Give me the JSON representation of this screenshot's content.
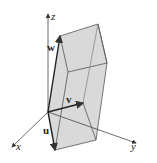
{
  "figure": {
    "type": "parallelepiped",
    "axes": {
      "x_label": "x",
      "y_label": "y",
      "z_label": "z"
    },
    "vectors": {
      "u_label": "u",
      "v_label": "v",
      "w_label": "w"
    },
    "colors": {
      "face_fill": "#d9d9d9",
      "edge": "#555555",
      "axis": "#444444",
      "background": "#ffffff"
    }
  }
}
